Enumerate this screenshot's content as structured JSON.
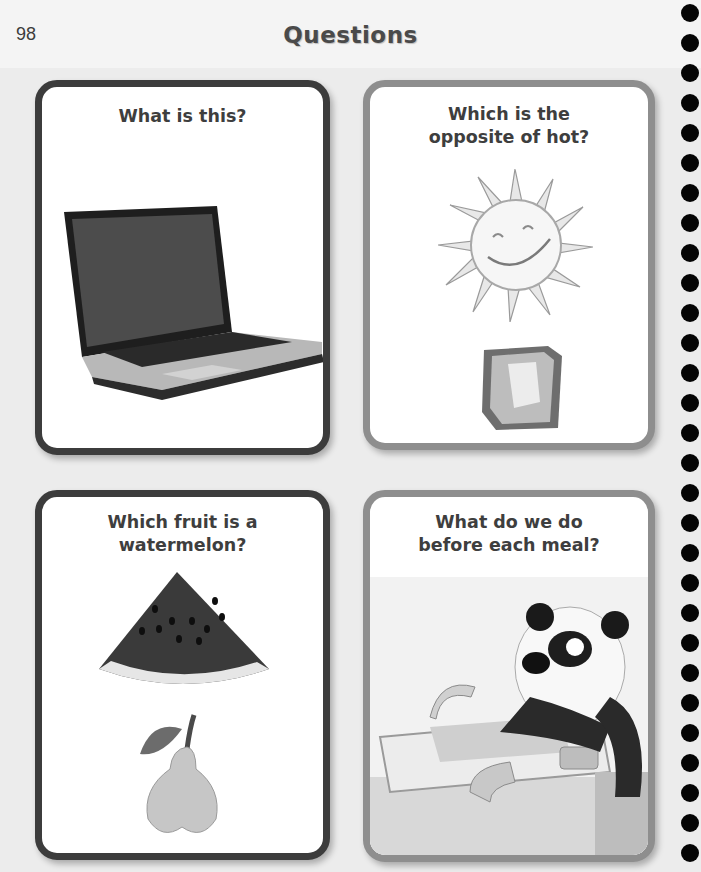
{
  "page": {
    "number": "98",
    "title": "Questions"
  },
  "cards": [
    {
      "question": "What is this?",
      "images": [
        "laptop"
      ]
    },
    {
      "question": "Which is the opposite of hot?",
      "images": [
        "sun",
        "ice-cube"
      ]
    },
    {
      "question": "Which fruit is a watermelon?",
      "images": [
        "watermelon-slice",
        "pear"
      ]
    },
    {
      "question": "What do we do before each meal?",
      "images": [
        "panda-washing-hands"
      ]
    }
  ],
  "colors": {
    "background": "#ececec",
    "card_border_dark": "#3c3c3c",
    "card_border_grey": "#8e8e8e",
    "spiral_binding": "#050505"
  },
  "spiral": {
    "dot_count": 29
  }
}
